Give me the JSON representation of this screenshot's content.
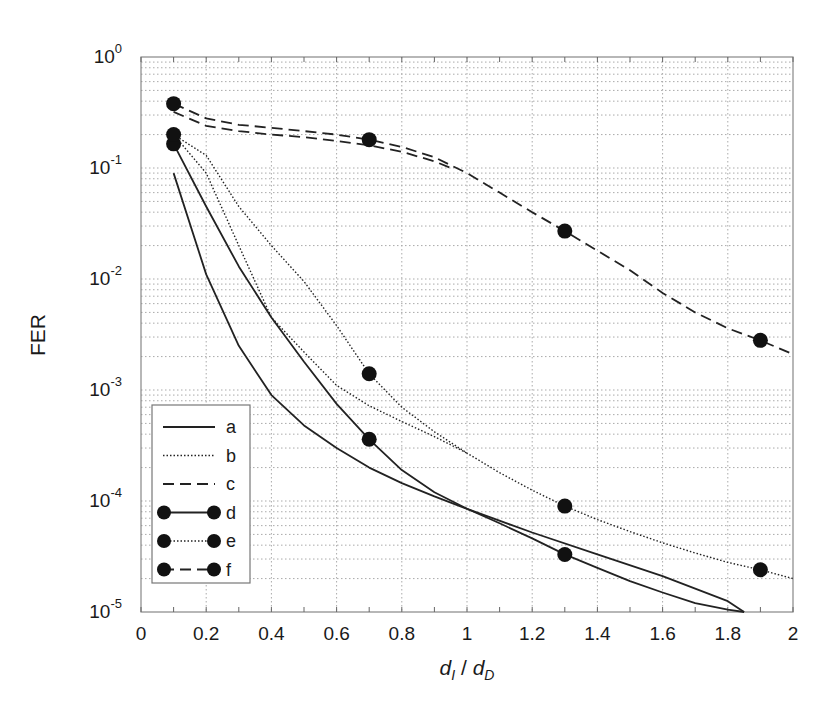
{
  "chart_data": {
    "type": "line",
    "title": "",
    "xlabel": "d_I / d_D",
    "xlabel_parts": {
      "d1": "d",
      "sub1": "I",
      "sep": " / ",
      "d2": "d",
      "sub2": "D"
    },
    "ylabel": "FER",
    "yscale": "log",
    "xlim": [
      0,
      2
    ],
    "ylim": [
      1e-05,
      1
    ],
    "grid": true,
    "legend_position": "lower left",
    "x_ticks": [
      "0",
      "0.2",
      "0.4",
      "0.6",
      "0.8",
      "1",
      "1.2",
      "1.4",
      "1.6",
      "1.8",
      "2"
    ],
    "y_ticks": [
      {
        "base": "10",
        "exp": "0",
        "value": 1
      },
      {
        "base": "10",
        "exp": "-1",
        "value": 0.1
      },
      {
        "base": "10",
        "exp": "-2",
        "value": 0.01
      },
      {
        "base": "10",
        "exp": "-3",
        "value": 0.001
      },
      {
        "base": "10",
        "exp": "-4",
        "value": 0.0001
      },
      {
        "base": "10",
        "exp": "-5",
        "value": 1e-05
      }
    ],
    "series": [
      {
        "name": "a",
        "style": "solid",
        "markers": false,
        "x": [
          0.1,
          0.2,
          0.3,
          0.4,
          0.5,
          0.6,
          0.7,
          0.8,
          0.9,
          1.0,
          1.2,
          1.4,
          1.6,
          1.8,
          1.85
        ],
        "y": [
          0.09,
          0.011,
          0.0025,
          0.0009,
          0.00048,
          0.0003,
          0.0002,
          0.000145,
          0.00011,
          8.5e-05,
          5.2e-05,
          3.3e-05,
          2.1e-05,
          1.25e-05,
          1e-05
        ]
      },
      {
        "name": "b",
        "style": "dotted",
        "markers": false,
        "x": [
          0.1,
          0.2,
          0.3,
          0.4,
          0.5,
          0.6,
          0.7,
          0.8,
          0.9,
          1.0
        ],
        "y": [
          0.2,
          0.09,
          0.02,
          0.0045,
          0.0022,
          0.0011,
          0.00072,
          0.00052,
          0.00038,
          0.00027
        ]
      },
      {
        "name": "c",
        "style": "dashed",
        "markers": false,
        "x": [
          0.1,
          0.2,
          0.3,
          0.4,
          0.5,
          0.6,
          0.7,
          0.8,
          0.9,
          0.95
        ],
        "y": [
          0.32,
          0.24,
          0.215,
          0.2,
          0.19,
          0.175,
          0.16,
          0.14,
          0.115,
          0.1
        ]
      },
      {
        "name": "d",
        "style": "solid",
        "markers": true,
        "marker_x": [
          0.1,
          0.7,
          1.3
        ],
        "marker_y": [
          0.165,
          0.00036,
          3.3e-05
        ],
        "x": [
          0.1,
          0.2,
          0.3,
          0.4,
          0.5,
          0.6,
          0.7,
          0.8,
          0.9,
          1.0,
          1.1,
          1.2,
          1.3,
          1.4,
          1.5,
          1.6,
          1.7,
          1.8,
          1.85
        ],
        "y": [
          0.165,
          0.045,
          0.013,
          0.0045,
          0.0018,
          0.00075,
          0.00036,
          0.00019,
          0.00012,
          8.5e-05,
          6.3e-05,
          4.6e-05,
          3.3e-05,
          2.5e-05,
          1.9e-05,
          1.5e-05,
          1.2e-05,
          1.05e-05,
          1e-05
        ]
      },
      {
        "name": "e",
        "style": "dotted",
        "markers": true,
        "marker_x": [
          0.1,
          0.7,
          1.3,
          1.9
        ],
        "marker_y": [
          0.2,
          0.0014,
          9e-05,
          2.4e-05
        ],
        "x": [
          0.1,
          0.2,
          0.3,
          0.4,
          0.5,
          0.6,
          0.7,
          0.8,
          0.9,
          1.0,
          1.1,
          1.2,
          1.3,
          1.4,
          1.5,
          1.6,
          1.7,
          1.8,
          1.9,
          2.0
        ],
        "y": [
          0.2,
          0.13,
          0.045,
          0.02,
          0.0095,
          0.0038,
          0.0014,
          0.0007,
          0.00042,
          0.00027,
          0.00018,
          0.000125,
          9e-05,
          6.8e-05,
          5.3e-05,
          4.2e-05,
          3.4e-05,
          2.8e-05,
          2.4e-05,
          2e-05
        ]
      },
      {
        "name": "f",
        "style": "dashed",
        "markers": true,
        "marker_x": [
          0.1,
          0.7,
          1.3,
          1.9
        ],
        "marker_y": [
          0.38,
          0.18,
          0.027,
          0.0028
        ],
        "x": [
          0.1,
          0.2,
          0.3,
          0.4,
          0.5,
          0.6,
          0.7,
          0.8,
          0.9,
          1.0,
          1.1,
          1.2,
          1.3,
          1.4,
          1.5,
          1.6,
          1.7,
          1.8,
          1.9,
          2.0
        ],
        "y": [
          0.38,
          0.28,
          0.245,
          0.23,
          0.215,
          0.2,
          0.18,
          0.155,
          0.125,
          0.09,
          0.06,
          0.04,
          0.027,
          0.018,
          0.012,
          0.0075,
          0.005,
          0.0036,
          0.0028,
          0.0021
        ]
      }
    ]
  }
}
